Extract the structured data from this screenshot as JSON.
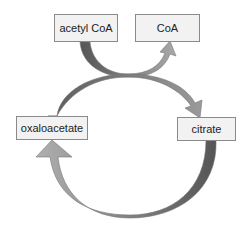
{
  "diagram": {
    "type": "reaction-cycle",
    "nodes": [
      {
        "id": "acetyl_coa",
        "label": "acetyl CoA"
      },
      {
        "id": "coa",
        "label": "CoA"
      },
      {
        "id": "oxaloacetate",
        "label": "oxaloacetate"
      },
      {
        "id": "citrate",
        "label": "citrate"
      }
    ],
    "edges": [
      {
        "from": "acetyl_coa",
        "to": "coa",
        "style": "curved-arrow"
      },
      {
        "from": "oxaloacetate",
        "to": "citrate",
        "style": "curved-arrow"
      },
      {
        "from": "citrate",
        "to": "oxaloacetate",
        "style": "curved-arrow"
      }
    ],
    "colors": {
      "box_fill": "#f2f2f2",
      "box_border": "#8a8a8a",
      "arrow_dark": "#5a5a5a",
      "arrow_light": "#a8a8a8"
    }
  }
}
